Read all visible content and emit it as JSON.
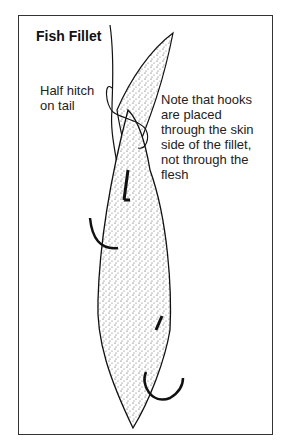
{
  "figure": {
    "title": "Fish Fillet",
    "labels": {
      "half_hitch": [
        "Half hitch",
        "on tail"
      ],
      "note": [
        "Note that hooks",
        "are placed",
        "through the skin",
        "side of the fillet,",
        "not through the",
        "flesh"
      ]
    }
  }
}
